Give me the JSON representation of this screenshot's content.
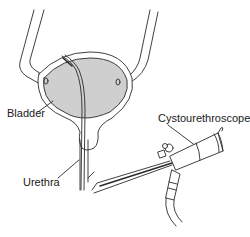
{
  "diagram": {
    "labels": {
      "bladder": "Bladder",
      "urethra": "Urethra",
      "cystourethroscope": "Cystourethroscope"
    },
    "colors": {
      "line": "#2a2a2a",
      "bladder_fill": "#cfcfcf",
      "background": "#ffffff"
    }
  }
}
